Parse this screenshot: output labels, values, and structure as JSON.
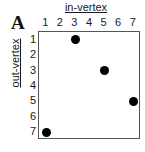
{
  "figure": {
    "panel_label": "A",
    "background_color": "#ffffff",
    "frame_color": "#555555",
    "point_color": "#000000"
  },
  "chart_data": {
    "type": "scatter",
    "title": "",
    "panel": "A",
    "xlabel": "in-vertex",
    "ylabel": "out-vertex",
    "xlim": [
      0.5,
      7.5
    ],
    "ylim": [
      0.5,
      7.5
    ],
    "x_axis_position": "top",
    "y_axis_direction": "inverted",
    "grid": false,
    "legend": null,
    "xticks": [
      1,
      2,
      3,
      4,
      5,
      6,
      7
    ],
    "yticks": [
      1,
      2,
      3,
      4,
      5,
      6,
      7
    ],
    "xtick_labels": [
      "1",
      "2",
      "3",
      "4",
      "5",
      "6",
      "7"
    ],
    "ytick_labels": [
      "1",
      "2",
      "3",
      "4",
      "5",
      "6",
      "7"
    ],
    "points": [
      {
        "x": 3,
        "y": 1
      },
      {
        "x": 5,
        "y": 3
      },
      {
        "x": 7,
        "y": 5
      },
      {
        "x": 1,
        "y": 7
      }
    ],
    "x": [
      3,
      5,
      7,
      1
    ],
    "values": [
      1,
      3,
      5,
      7
    ]
  }
}
